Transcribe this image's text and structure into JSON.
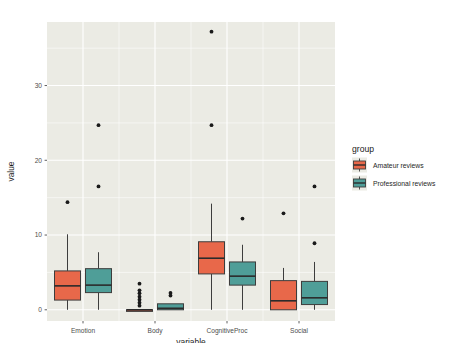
{
  "chart_data": {
    "type": "box",
    "title": "",
    "xlabel": "variable",
    "ylabel": "value",
    "categories": [
      "Emotion",
      "Body",
      "CognitiveProc",
      "Social"
    ],
    "ylim": [
      -1.5,
      38.5
    ],
    "yticks": [
      0,
      10,
      20,
      30
    ],
    "ytick_labels": [
      "0",
      "10",
      "20",
      "30"
    ],
    "grid": true,
    "legend_position": "right",
    "legend_title": "group",
    "panel_background": "#ebebe4",
    "grid_color": "#ffffff",
    "series": [
      {
        "name": "Amateur reviews",
        "color": "#e8684a",
        "boxes": [
          {
            "category": "Emotion",
            "min": 0.0,
            "q1": 1.3,
            "median": 3.2,
            "q3": 5.2,
            "max": 10.1,
            "outliers": [
              14.4
            ]
          },
          {
            "category": "Body",
            "min": 0.0,
            "q1": 0.0,
            "median": 0.0,
            "q3": 0.0,
            "max": 0.0,
            "outliers": [
              0.55,
              0.95,
              1.35,
              1.75,
              2.2,
              2.6,
              3.5
            ]
          },
          {
            "category": "CognitiveProc",
            "min": 0.0,
            "q1": 4.8,
            "median": 6.9,
            "q3": 9.1,
            "max": 14.2,
            "outliers": [
              24.7,
              37.2
            ]
          },
          {
            "category": "Social",
            "min": 0.0,
            "q1": 0.0,
            "median": 1.2,
            "q3": 3.9,
            "max": 5.6,
            "outliers": [
              12.9
            ]
          }
        ]
      },
      {
        "name": "Professional reviews",
        "color": "#4f9e98",
        "boxes": [
          {
            "category": "Emotion",
            "min": 0.0,
            "q1": 2.3,
            "median": 3.3,
            "q3": 5.5,
            "max": 7.7,
            "outliers": [
              16.5,
              24.7
            ]
          },
          {
            "category": "Body",
            "min": 0.0,
            "q1": 0.0,
            "median": 0.2,
            "q3": 0.8,
            "max": 0.8,
            "outliers": [
              1.9,
              2.25
            ]
          },
          {
            "category": "CognitiveProc",
            "min": 0.0,
            "q1": 3.3,
            "median": 4.5,
            "q3": 6.4,
            "max": 8.7,
            "outliers": [
              12.2
            ]
          },
          {
            "category": "Social",
            "min": 0.0,
            "q1": 0.7,
            "median": 1.6,
            "q3": 3.8,
            "max": 6.4,
            "outliers": [
              8.9,
              16.5
            ]
          }
        ]
      }
    ]
  },
  "legend": {
    "title": "group",
    "items": [
      {
        "label": "Amateur reviews",
        "color": "#e8684a"
      },
      {
        "label": "Professional reviews",
        "color": "#4f9e98"
      }
    ]
  },
  "axes": {
    "y_title": "value",
    "x_title": "variable",
    "y_tick_labels": [
      "0",
      "10",
      "20",
      "30"
    ],
    "x_tick_labels": [
      "Emotion",
      "Body",
      "CognitiveProc",
      "Social"
    ]
  },
  "caption": {
    "text": "Figure 11. Results of Continuous Analysis on the Social...",
    "visible": false
  }
}
